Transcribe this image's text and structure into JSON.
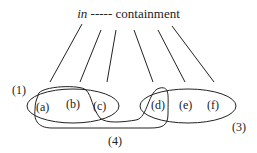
{
  "title": {
    "italic": "in",
    "dashes": "-----",
    "word": "containment"
  },
  "nodes": [
    {
      "id": "a",
      "label": "(a)"
    },
    {
      "id": "b",
      "label": "(b)"
    },
    {
      "id": "c",
      "label": "(c)"
    },
    {
      "id": "d",
      "label": "(d)"
    },
    {
      "id": "e",
      "label": "(e)"
    },
    {
      "id": "f",
      "label": "(f)"
    }
  ],
  "sets": [
    {
      "id": "1",
      "label": "(1)"
    },
    {
      "id": "3",
      "label": "(3)"
    },
    {
      "id": "4",
      "label": "(4)"
    }
  ],
  "colors": {
    "stroke": "#222222"
  }
}
